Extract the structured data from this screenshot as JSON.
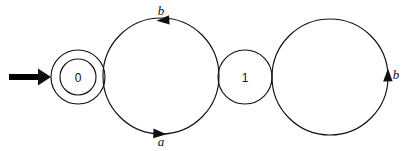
{
  "diagram": {
    "kind": "finite-state-automaton",
    "title": "",
    "background_color": "#ffffff",
    "stroke_color": "#111111",
    "states": [
      {
        "id": "q0",
        "label": "0",
        "accepting": true,
        "initial": true,
        "cx": 78,
        "cy": 77,
        "r_outer": 27,
        "r_inner": 18
      },
      {
        "id": "q1",
        "label": "1",
        "accepting": false,
        "initial": false,
        "cx": 245,
        "cy": 77,
        "r_outer": 27,
        "r_inner": 0
      }
    ],
    "transitions": [
      {
        "id": "t-a",
        "from": "q0",
        "to": "q1",
        "label": "a",
        "label_x": 161,
        "label_y": 146,
        "arrow_direction": "right",
        "position": "bottom"
      },
      {
        "id": "t-b",
        "from": "q1",
        "to": "q0",
        "label": "b",
        "label_x": 161,
        "label_y": 15,
        "arrow_direction": "left",
        "position": "top"
      },
      {
        "id": "t-b-self",
        "from": "q1",
        "to": "q1",
        "label": "b",
        "label_x": 396,
        "label_y": 79,
        "arrow_direction": "up",
        "position": "right-loop"
      }
    ],
    "start_arrow": {
      "id": "start-arrow",
      "x_start": 8,
      "x_end": 48,
      "y": 77,
      "color": "#000000"
    },
    "alphabet": [
      "a",
      "b"
    ],
    "initial_state_label": "0",
    "accepting_state_labels": [
      "0"
    ]
  }
}
